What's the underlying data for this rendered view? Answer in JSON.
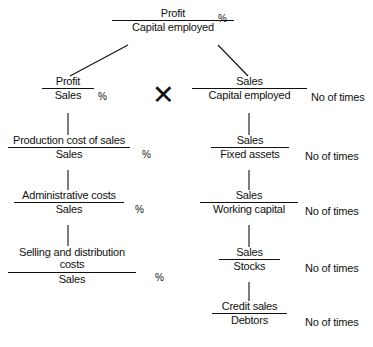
{
  "figure": {
    "caption": "",
    "multiply_symbol": "✕"
  },
  "labels": {
    "percent": "%",
    "no_of_times": "No  of times"
  },
  "nodes": {
    "root": {
      "numerator": "Profit",
      "denominator": "Capital employed",
      "unit": "%"
    },
    "left": [
      {
        "numerator": "Profit",
        "denominator": "Sales",
        "unit": "%"
      },
      {
        "numerator": "Production cost of sales",
        "denominator": "Sales",
        "unit": "%"
      },
      {
        "numerator": "Administrative costs",
        "denominator": "Sales",
        "unit": "%"
      },
      {
        "numerator": "Selling and distribution costs",
        "denominator": "Sales",
        "unit": "%"
      }
    ],
    "right": [
      {
        "numerator": "Sales",
        "denominator": "Capital employed",
        "unit": "No  of times"
      },
      {
        "numerator": "Sales",
        "denominator": "Fixed assets",
        "unit": "No  of times"
      },
      {
        "numerator": "Sales",
        "denominator": "Working capital",
        "unit": "No  of times"
      },
      {
        "numerator": "Sales",
        "denominator": "Stocks",
        "unit": "No  of times"
      },
      {
        "numerator": "Credit sales",
        "denominator": "Debtors",
        "unit": "No  of times"
      }
    ]
  },
  "colors": {
    "ink": "#111111",
    "background": "#ffffff"
  }
}
